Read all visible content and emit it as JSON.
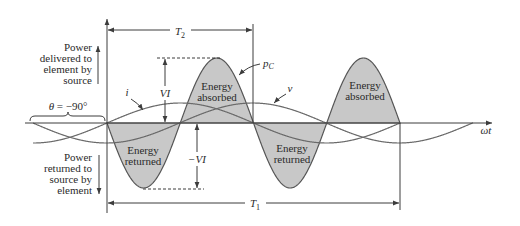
{
  "figure": {
    "power_delivered_label": [
      "Power",
      "delivered to",
      "element by",
      "source"
    ],
    "power_returned_label": [
      "Power",
      "returned to",
      "source by",
      "element"
    ],
    "phase_label": {
      "symbol": "θ",
      "value": " = −90°"
    },
    "axis_label": "ωt",
    "period_labels": {
      "T2": {
        "symbol": "T",
        "subscript": "2"
      },
      "T1": {
        "symbol": "T",
        "subscript": "1"
      }
    },
    "amplitude_labels": {
      "positive": "VI",
      "negative": "−VI"
    },
    "curve_labels": {
      "current": "i",
      "voltage": "v",
      "power": {
        "symbol": "p",
        "subscript": "C"
      }
    },
    "lobes": [
      {
        "line1": "Energy",
        "line2": "returned"
      },
      {
        "line1": "Energy",
        "line2": "absorbed"
      },
      {
        "line1": "Energy",
        "line2": "returned"
      },
      {
        "line1": "Energy",
        "line2": "absorbed"
      }
    ]
  },
  "waveforms": {
    "axis_y": 123,
    "period_px": 293,
    "phase_deg": -90,
    "power": {
      "amplitude_px": 65,
      "zero_x": 107,
      "x_start": 107,
      "x_end": 400
    },
    "voltage": {
      "amplitude_px": 20,
      "zero_x": 33,
      "x_start": 33,
      "x_end": 473
    },
    "current": {
      "amplitude_px": 20,
      "zero_x": 107,
      "x_start": 33,
      "x_end": 400
    }
  },
  "colors": {
    "line": "#3c3c3c",
    "fill": "#c8c8c8",
    "curve": "#6a6a6a",
    "text": "#2a2a2a"
  }
}
